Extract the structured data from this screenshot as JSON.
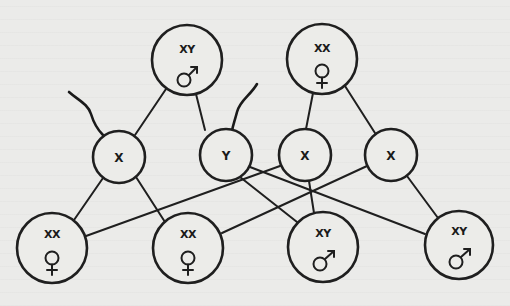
{
  "diagram": {
    "type": "sex-determination-inheritance",
    "colors": {
      "ink": "#1f1f1f",
      "paper": "#ebebe9"
    },
    "parents": [
      {
        "id": "p_male",
        "genotype": "XY",
        "sex_symbol": "male-symbol",
        "cx": 187,
        "cy": 60,
        "r": 35
      },
      {
        "id": "p_female",
        "genotype": "XX",
        "sex_symbol": "female-symbol",
        "cx": 322,
        "cy": 59,
        "r": 35
      }
    ],
    "gametes": [
      {
        "id": "g1",
        "chromosome": "X",
        "from": "p_male",
        "type": "sperm",
        "cx": 119,
        "cy": 157,
        "r": 26
      },
      {
        "id": "g2",
        "chromosome": "Y",
        "from": "p_male",
        "type": "sperm",
        "cx": 226,
        "cy": 155,
        "r": 26
      },
      {
        "id": "g3",
        "chromosome": "X",
        "from": "p_female",
        "type": "egg",
        "cx": 305,
        "cy": 155,
        "r": 26
      },
      {
        "id": "g4",
        "chromosome": "X",
        "from": "p_female",
        "type": "egg",
        "cx": 391,
        "cy": 155,
        "r": 26
      }
    ],
    "offspring": [
      {
        "id": "o1",
        "genotype": "XX",
        "sex_symbol": "female-symbol",
        "parents_gametes": [
          "g1",
          "g3"
        ],
        "cx": 52,
        "cy": 248,
        "r": 35
      },
      {
        "id": "o2",
        "genotype": "XX",
        "sex_symbol": "female-symbol",
        "parents_gametes": [
          "g1",
          "g4"
        ],
        "cx": 188,
        "cy": 248,
        "r": 35
      },
      {
        "id": "o3",
        "genotype": "XY",
        "sex_symbol": "male-symbol",
        "parents_gametes": [
          "g2",
          "g3"
        ],
        "cx": 323,
        "cy": 247,
        "r": 35
      },
      {
        "id": "o4",
        "genotype": "XY",
        "sex_symbol": "male-symbol",
        "parents_gametes": [
          "g2",
          "g4"
        ],
        "cx": 459,
        "cy": 245,
        "r": 34
      }
    ],
    "labels": {
      "parent_male": "XY",
      "parent_female": "XX",
      "gamete_1": "X",
      "gamete_2": "Y",
      "gamete_3": "X",
      "gamete_4": "X",
      "offspring_1": "XX",
      "offspring_2": "XX",
      "offspring_3": "XY",
      "offspring_4": "XY"
    }
  }
}
